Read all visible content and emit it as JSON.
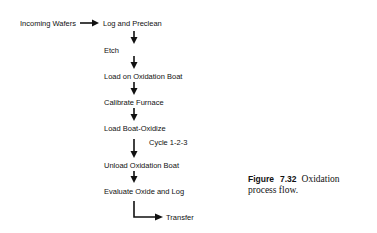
{
  "diagram": {
    "input": "Incoming Wafers",
    "steps": [
      "Log and Preclean",
      "Etch",
      "Load on Oxidation Boat",
      "Calibrate Furnace",
      "Load Boat-Oxidize",
      "Unload Oxidation Boat",
      "Evaluate Oxide and Log"
    ],
    "cycle_label": "Cycle  1-2-3",
    "output": "Transfer"
  },
  "caption": {
    "figure_label": "Figure",
    "figure_number": "7.32",
    "text": "Oxidation process flow."
  }
}
